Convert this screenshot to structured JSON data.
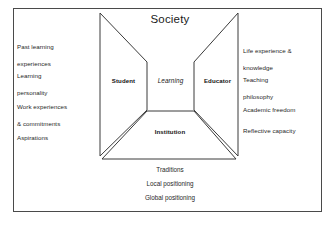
{
  "figure": {
    "title": "Society",
    "frame_color": "#4a4a4a",
    "line_color": "#3a3a3a",
    "background": "#ffffff"
  },
  "diagram": {
    "center_label": "Learning",
    "nodes": [
      {
        "id": "student",
        "label": "Student",
        "position": "left-wing"
      },
      {
        "id": "educator",
        "label": "Educator",
        "position": "right-wing"
      },
      {
        "id": "institution",
        "label": "Institution",
        "position": "bottom-trapezoid"
      }
    ]
  },
  "left_column": {
    "items": [
      {
        "line1": "Past learning",
        "line2": "experiences"
      },
      {
        "line1": "Learning",
        "line2": "personality"
      },
      {
        "line1": "Work experiences",
        "line2": "& commitments"
      },
      {
        "line1": "Aspirations",
        "line2": ""
      }
    ]
  },
  "right_column": {
    "items": [
      {
        "line1": "Life experience &",
        "line2": "knowledge"
      },
      {
        "line1": "Teaching",
        "line2": "philosophy"
      },
      {
        "line1": "Academic freedom",
        "line2": ""
      },
      {
        "line1": "Reflective capacity",
        "line2": ""
      }
    ]
  },
  "bottom_column": {
    "items": [
      {
        "label": "Traditions"
      },
      {
        "label": "Local positioning"
      },
      {
        "label": "Global positioning"
      }
    ]
  }
}
